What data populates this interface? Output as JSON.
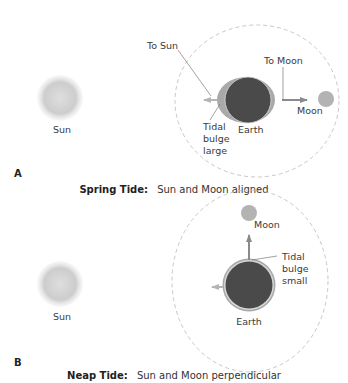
{
  "figure": {
    "panels": [
      {
        "id": "A",
        "panel_label": "A",
        "caption_bold": "Spring Tide:",
        "caption_text": "Sun and Moon aligned",
        "labels": {
          "sun": "Sun",
          "to_sun": "To Sun",
          "to_moon": "To Moon",
          "moon": "Moon",
          "earth": "Earth",
          "tidal_line1": "Tidal",
          "tidal_line2": "bulge",
          "tidal_line3": "large"
        }
      },
      {
        "id": "B",
        "panel_label": "B",
        "caption_bold": "Neap Tide:",
        "caption_text": "Sun and Moon perpendicular",
        "labels": {
          "sun": "Sun",
          "moon": "Moon",
          "earth": "Earth",
          "tidal_line1": "Tidal",
          "tidal_line2": "bulge",
          "tidal_line3": "small"
        }
      }
    ],
    "colors": {
      "sun": "#cfcfcf",
      "earth": "#4a4a4a",
      "bulge": "#a9a9a9",
      "moon": "#b3b3b3",
      "orbit": "#c8c8c8",
      "arrow": "#8a8a8a",
      "leader": "#7a7a7a"
    }
  }
}
